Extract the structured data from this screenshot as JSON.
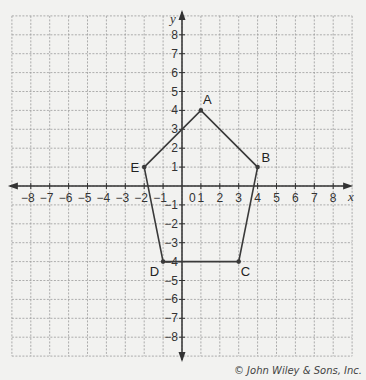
{
  "chart_data": {
    "type": "scatter",
    "title": "",
    "xlabel": "x",
    "ylabel": "y",
    "xlim": [
      -9,
      9
    ],
    "ylim": [
      -9,
      9
    ],
    "grid": true,
    "x_ticks": [
      -8,
      -7,
      -6,
      -5,
      -4,
      -3,
      -2,
      -1,
      1,
      2,
      3,
      4,
      5,
      6,
      7,
      8
    ],
    "y_ticks": [
      8,
      7,
      6,
      5,
      4,
      3,
      2,
      1,
      -1,
      -2,
      -3,
      -4,
      -5,
      -6,
      -7,
      -8
    ],
    "origin_label": "0",
    "polygon": {
      "name": "pentagon ABCDE",
      "closed": true,
      "points": [
        {
          "label": "A",
          "x": 1,
          "y": 4
        },
        {
          "label": "B",
          "x": 4,
          "y": 1
        },
        {
          "label": "C",
          "x": 3,
          "y": -4
        },
        {
          "label": "D",
          "x": -1,
          "y": -4
        },
        {
          "label": "E",
          "x": -2,
          "y": 1
        }
      ]
    },
    "colors": {
      "grid": "#9a9a9a",
      "axis": "#333333",
      "polygon": "#3a3a3a",
      "background": "#f2f2f0"
    }
  },
  "credit": "© John Wiley & Sons, Inc."
}
